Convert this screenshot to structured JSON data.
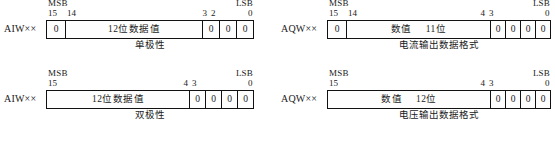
{
  "diagrams": [
    {
      "name": "analog-input-unipolar",
      "row_label": "AIW××",
      "msb_label": "MSB",
      "lsb_label": "LSB",
      "caption": "单极性",
      "ticks": [
        {
          "text": "15",
          "anchor": "left"
        },
        {
          "text": "14",
          "anchor": "left"
        },
        {
          "text": "3",
          "anchor": "right"
        },
        {
          "text": "2",
          "anchor": "left"
        },
        {
          "text": "0",
          "anchor": "left"
        }
      ],
      "cells": [
        {
          "type": "zero",
          "text": "0"
        },
        {
          "type": "field",
          "text": "12位数据值"
        },
        {
          "type": "zero",
          "text": "0"
        },
        {
          "type": "zero",
          "text": "0"
        },
        {
          "type": "zero",
          "text": "0"
        }
      ]
    },
    {
      "name": "analog-output-current",
      "row_label": "AQW××",
      "msb_label": "MSB",
      "lsb_label": "LSB",
      "caption": "电流输出数据格式",
      "ticks": [
        {
          "text": "15",
          "anchor": "left"
        },
        {
          "text": "14",
          "anchor": "left"
        },
        {
          "text": "4",
          "anchor": "right"
        },
        {
          "text": "3",
          "anchor": "left"
        },
        {
          "text": "0",
          "anchor": "left"
        }
      ],
      "cells": [
        {
          "type": "zero",
          "text": "0"
        },
        {
          "type": "field",
          "text": "数值",
          "text2": "11位"
        },
        {
          "type": "zero",
          "text": "0"
        },
        {
          "type": "zero",
          "text": "0"
        },
        {
          "type": "zero",
          "text": "0"
        },
        {
          "type": "zero",
          "text": "0"
        }
      ]
    },
    {
      "name": "analog-input-bipolar",
      "row_label": "AIW××",
      "msb_label": "MSB",
      "lsb_label": "LSB",
      "caption": "双极性",
      "ticks": [
        {
          "text": "15",
          "anchor": "left"
        },
        {
          "text": "4",
          "anchor": "right"
        },
        {
          "text": "3",
          "anchor": "left"
        },
        {
          "text": "0",
          "anchor": "left"
        }
      ],
      "cells": [
        {
          "type": "field",
          "text": "12位数据值"
        },
        {
          "type": "zero",
          "text": "0"
        },
        {
          "type": "zero",
          "text": "0"
        },
        {
          "type": "zero",
          "text": "0"
        },
        {
          "type": "zero",
          "text": "0"
        }
      ]
    },
    {
      "name": "analog-output-voltage",
      "row_label": "AQW××",
      "msb_label": "MSB",
      "lsb_label": "LSB",
      "caption": "电压输出数据格式",
      "ticks": [
        {
          "text": "15",
          "anchor": "left"
        },
        {
          "text": "4",
          "anchor": "right"
        },
        {
          "text": "3",
          "anchor": "left"
        },
        {
          "text": "0",
          "anchor": "left"
        }
      ],
      "cells": [
        {
          "type": "field",
          "text": "数值",
          "text2": "12位"
        },
        {
          "type": "zero",
          "text": "0"
        },
        {
          "type": "zero",
          "text": "0"
        },
        {
          "type": "zero",
          "text": "0"
        },
        {
          "type": "zero",
          "text": "0"
        }
      ]
    }
  ]
}
